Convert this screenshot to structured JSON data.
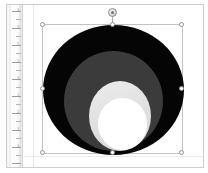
{
  "app": {
    "frame_name": "drawing-window",
    "canvas_background": "#ffffff"
  },
  "ruler": {
    "orientation": "vertical",
    "units": "inches",
    "labels": [
      "4",
      "3",
      "2",
      "1",
      "0",
      "1",
      "2",
      "3",
      "4"
    ],
    "tick_color": "#b4b6b9",
    "background": "#f6f6f6"
  },
  "selection": {
    "state": "selected",
    "box_color": "#bfc3c7",
    "handle_fill": "#ffffff",
    "handle_stroke": "#8e9296",
    "handles": [
      {
        "name": "handle-top-left",
        "position": "tl"
      },
      {
        "name": "handle-top-center",
        "position": "tc"
      },
      {
        "name": "handle-top-right",
        "position": "tr"
      },
      {
        "name": "handle-middle-left",
        "position": "ml"
      },
      {
        "name": "handle-middle-right",
        "position": "mr"
      },
      {
        "name": "handle-bottom-left",
        "position": "bl"
      },
      {
        "name": "handle-bottom-center",
        "position": "bc"
      },
      {
        "name": "handle-bottom-right",
        "position": "br"
      }
    ],
    "rotation_handle": {
      "name": "rotate-handle",
      "color": "#8b8f93"
    }
  },
  "shape": {
    "type": "concentric-circles",
    "count": 4,
    "layers": [
      {
        "name": "outer-circle",
        "color": "#050505",
        "label": "black"
      },
      {
        "name": "middle-circle",
        "color": "#3b3b3b",
        "label": "dark gray"
      },
      {
        "name": "inner-circle",
        "color": "#e2e2e2",
        "label": "light gray"
      },
      {
        "name": "core-circle",
        "color": "#ffffff",
        "label": "white"
      }
    ]
  }
}
